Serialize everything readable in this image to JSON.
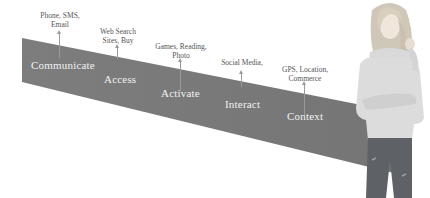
{
  "diagram": {
    "band_color": "#7a7a7a",
    "stages": [
      {
        "label": "Communicate",
        "callout": [
          "Phone, SMS,",
          "Email"
        ]
      },
      {
        "label": "Access",
        "callout": [
          "Web Search",
          "Sites, Buy"
        ]
      },
      {
        "label": "Activate",
        "callout": [
          "Games, Reading,",
          "Photo"
        ]
      },
      {
        "label": "Interact",
        "callout": [
          "Social Media,"
        ]
      },
      {
        "label": "Context",
        "callout": [
          "GPS, Location,",
          "Commerce"
        ]
      }
    ]
  },
  "image": {
    "subject": "woman in light grey cowl-neck sweater and jeans"
  }
}
